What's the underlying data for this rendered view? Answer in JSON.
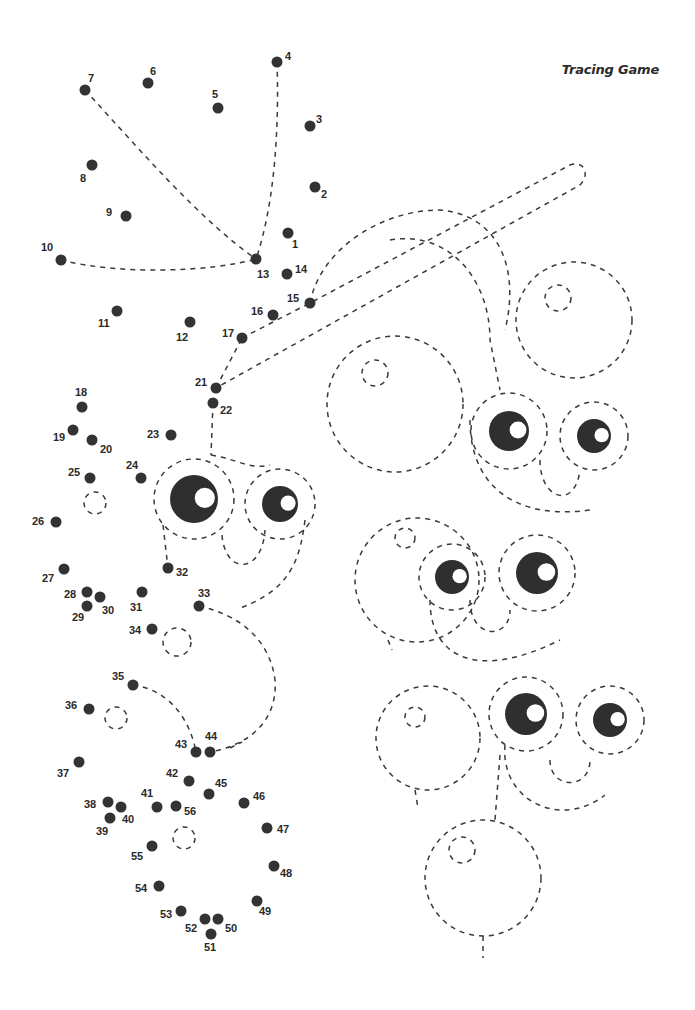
{
  "title": "Tracing Game",
  "colors": {
    "dot": "#333333",
    "line": "#3a3a3a",
    "pupil": "#2f2f2f",
    "background": "#ffffff"
  },
  "dots": [
    {
      "n": "1",
      "x": 288,
      "y": 233,
      "lx": 292,
      "ly": 248
    },
    {
      "n": "2",
      "x": 315,
      "y": 187,
      "lx": 321,
      "ly": 198
    },
    {
      "n": "3",
      "x": 310,
      "y": 126,
      "lx": 316,
      "ly": 123
    },
    {
      "n": "4",
      "x": 277,
      "y": 62,
      "lx": 285,
      "ly": 60
    },
    {
      "n": "5",
      "x": 218,
      "y": 108,
      "lx": 212,
      "ly": 98
    },
    {
      "n": "6",
      "x": 148,
      "y": 83,
      "lx": 150,
      "ly": 75
    },
    {
      "n": "7",
      "x": 85,
      "y": 90,
      "lx": 88,
      "ly": 82
    },
    {
      "n": "8",
      "x": 92,
      "y": 165,
      "lx": 80,
      "ly": 182
    },
    {
      "n": "9",
      "x": 126,
      "y": 216,
      "lx": 106,
      "ly": 216
    },
    {
      "n": "10",
      "x": 61,
      "y": 260,
      "lx": 41,
      "ly": 251
    },
    {
      "n": "11",
      "x": 117,
      "y": 311,
      "lx": 98,
      "ly": 327
    },
    {
      "n": "12",
      "x": 190,
      "y": 322,
      "lx": 176,
      "ly": 341
    },
    {
      "n": "13",
      "x": 256,
      "y": 259,
      "lx": 257,
      "ly": 278
    },
    {
      "n": "14",
      "x": 287,
      "y": 274,
      "lx": 295,
      "ly": 273
    },
    {
      "n": "15",
      "x": 310,
      "y": 303,
      "lx": 287,
      "ly": 302
    },
    {
      "n": "16",
      "x": 273,
      "y": 315,
      "lx": 251,
      "ly": 315
    },
    {
      "n": "17",
      "x": 242,
      "y": 338,
      "lx": 222,
      "ly": 337
    },
    {
      "n": "21",
      "x": 216,
      "y": 388,
      "lx": 195,
      "ly": 386
    },
    {
      "n": "22",
      "x": 213,
      "y": 403,
      "lx": 220,
      "ly": 414
    },
    {
      "n": "18",
      "x": 82,
      "y": 407,
      "lx": 75,
      "ly": 396
    },
    {
      "n": "19",
      "x": 73,
      "y": 430,
      "lx": 53,
      "ly": 441
    },
    {
      "n": "20",
      "x": 92,
      "y": 440,
      "lx": 100,
      "ly": 453
    },
    {
      "n": "23",
      "x": 171,
      "y": 435,
      "lx": 147,
      "ly": 438
    },
    {
      "n": "24",
      "x": 141,
      "y": 478,
      "lx": 126,
      "ly": 469
    },
    {
      "n": "25",
      "x": 90,
      "y": 478,
      "lx": 68,
      "ly": 476
    },
    {
      "n": "26",
      "x": 56,
      "y": 522,
      "lx": 32,
      "ly": 525
    },
    {
      "n": "27",
      "x": 64,
      "y": 569,
      "lx": 42,
      "ly": 582
    },
    {
      "n": "28",
      "x": 87,
      "y": 592,
      "lx": 64,
      "ly": 598
    },
    {
      "n": "29",
      "x": 87,
      "y": 606,
      "lx": 72,
      "ly": 621
    },
    {
      "n": "30",
      "x": 100,
      "y": 597,
      "lx": 102,
      "ly": 614
    },
    {
      "n": "31",
      "x": 142,
      "y": 592,
      "lx": 130,
      "ly": 611
    },
    {
      "n": "32",
      "x": 168,
      "y": 568,
      "lx": 176,
      "ly": 576
    },
    {
      "n": "33",
      "x": 199,
      "y": 606,
      "lx": 198,
      "ly": 597
    },
    {
      "n": "34",
      "x": 152,
      "y": 629,
      "lx": 129,
      "ly": 634
    },
    {
      "n": "35",
      "x": 133,
      "y": 685,
      "lx": 112,
      "ly": 680
    },
    {
      "n": "36",
      "x": 89,
      "y": 709,
      "lx": 65,
      "ly": 709
    },
    {
      "n": "37",
      "x": 79,
      "y": 762,
      "lx": 57,
      "ly": 777
    },
    {
      "n": "38",
      "x": 108,
      "y": 802,
      "lx": 84,
      "ly": 808
    },
    {
      "n": "39",
      "x": 110,
      "y": 818,
      "lx": 96,
      "ly": 835
    },
    {
      "n": "40",
      "x": 121,
      "y": 807,
      "lx": 122,
      "ly": 823
    },
    {
      "n": "41",
      "x": 157,
      "y": 807,
      "lx": 141,
      "ly": 797
    },
    {
      "n": "42",
      "x": 189,
      "y": 781,
      "lx": 166,
      "ly": 777
    },
    {
      "n": "43",
      "x": 196,
      "y": 752,
      "lx": 175,
      "ly": 748
    },
    {
      "n": "44",
      "x": 210,
      "y": 752,
      "lx": 205,
      "ly": 740
    },
    {
      "n": "45",
      "x": 209,
      "y": 794,
      "lx": 215,
      "ly": 787
    },
    {
      "n": "46",
      "x": 244,
      "y": 803,
      "lx": 253,
      "ly": 800
    },
    {
      "n": "47",
      "x": 267,
      "y": 828,
      "lx": 277,
      "ly": 833
    },
    {
      "n": "48",
      "x": 274,
      "y": 866,
      "lx": 280,
      "ly": 877
    },
    {
      "n": "49",
      "x": 257,
      "y": 901,
      "lx": 259,
      "ly": 915
    },
    {
      "n": "50",
      "x": 218,
      "y": 919,
      "lx": 225,
      "ly": 932
    },
    {
      "n": "51",
      "x": 211,
      "y": 934,
      "lx": 204,
      "ly": 951
    },
    {
      "n": "52",
      "x": 205,
      "y": 919,
      "lx": 185,
      "ly": 932
    },
    {
      "n": "53",
      "x": 181,
      "y": 911,
      "lx": 160,
      "ly": 918
    },
    {
      "n": "54",
      "x": 159,
      "y": 886,
      "lx": 135,
      "ly": 892
    },
    {
      "n": "55",
      "x": 152,
      "y": 846,
      "lx": 131,
      "ly": 860
    },
    {
      "n": "56",
      "x": 176,
      "y": 806,
      "lx": 184,
      "ly": 815
    }
  ],
  "eyes": [
    {
      "cx": 194,
      "cy": 499,
      "r": 24,
      "ring": 40
    },
    {
      "cx": 280,
      "cy": 504,
      "r": 18,
      "ring": 35
    },
    {
      "cx": 509,
      "cy": 431,
      "r": 20,
      "ring": 38
    },
    {
      "cx": 594,
      "cy": 436,
      "r": 17,
      "ring": 34
    },
    {
      "cx": 452,
      "cy": 577,
      "r": 17,
      "ring": 33
    },
    {
      "cx": 537,
      "cy": 573,
      "r": 21,
      "ring": 38
    },
    {
      "cx": 526,
      "cy": 714,
      "r": 21,
      "ring": 37
    },
    {
      "cx": 610,
      "cy": 720,
      "r": 17,
      "ring": 34
    }
  ]
}
